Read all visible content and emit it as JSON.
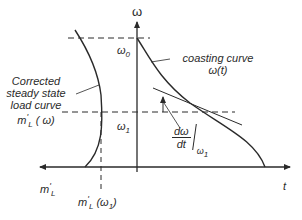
{
  "diagram": {
    "axes": {
      "vertical_label": "ω",
      "horizontal_label": "t"
    },
    "levels": {
      "omega0": {
        "symbol": "ω",
        "subscript": "0"
      },
      "omega1": {
        "symbol": "ω",
        "subscript": "1"
      }
    },
    "curves": {
      "coasting": {
        "line1": "coasting curve",
        "line2": "ω(t)"
      },
      "load": {
        "line1": "Corrected",
        "line2": "steady state",
        "line3": "load curve",
        "line4_base": "m",
        "line4_prime": "'",
        "line4_sub": "L",
        "line4_arg": " ( ω)"
      }
    },
    "slope_label": {
      "numerator": "dω",
      "denominator": "dt",
      "eval_symbol": "ω",
      "eval_sub": "1"
    },
    "left_axis_label": {
      "base": "m",
      "prime": "'",
      "sub": "L"
    },
    "intersection_label": {
      "base": "m",
      "prime": "'",
      "sub": "L",
      "arg_open": " (ω",
      "arg_sub": "1",
      "arg_close": ")"
    },
    "colors": {
      "line": "#2a2a2a",
      "background": "#ffffff"
    }
  }
}
